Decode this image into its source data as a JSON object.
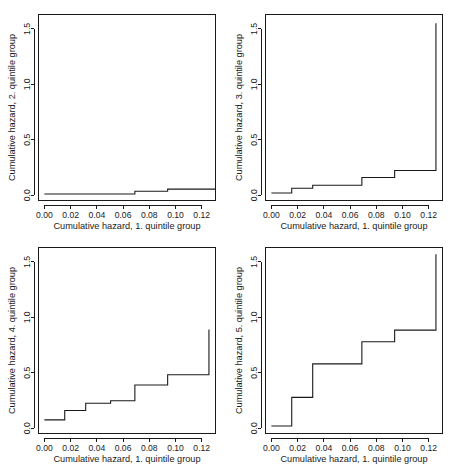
{
  "figure": {
    "background_color": "#ffffff",
    "line_color": "#1a1a1a",
    "panel_layout": "2x2",
    "panel_count": 4
  },
  "axes": {
    "x_ticks": [
      "0.00",
      "0.02",
      "0.04",
      "0.06",
      "0.08",
      "0.10",
      "0.12"
    ],
    "x_tick_values": [
      0.0,
      0.02,
      0.04,
      0.06,
      0.08,
      0.1,
      0.12
    ],
    "y_ticks": [
      "0.0",
      "0.5",
      "1.0",
      "1.5"
    ],
    "y_tick_values": [
      0.0,
      0.5,
      1.0,
      1.5
    ],
    "xlim": [
      -0.0045,
      0.1305
    ],
    "ylim": [
      -0.048,
      1.63
    ],
    "xlabel": "Cumulative hazard, 1. quintile group"
  },
  "chart_data": [
    {
      "type": "line",
      "subplot": "top-left",
      "title": "",
      "xlabel": "Cumulative hazard, 1. quintile group",
      "ylabel": "Cumulative hazard, 2. quintile group",
      "xlim": [
        -0.0045,
        0.1305
      ],
      "ylim": [
        -0.048,
        1.63
      ],
      "grid": false,
      "legend": "none",
      "step_style": "post",
      "x": [
        0.0,
        0.0155,
        0.0315,
        0.0505,
        0.069,
        0.094,
        0.1255
      ],
      "y": [
        0.01,
        0.01,
        0.01,
        0.01,
        0.035,
        0.055,
        0.055
      ],
      "xtick_labels": [
        "0.00",
        "0.02",
        "0.04",
        "0.06",
        "0.08",
        "0.10",
        "0.12"
      ],
      "ytick_labels": [
        "0.0",
        "0.5",
        "1.0",
        "1.5"
      ]
    },
    {
      "type": "line",
      "subplot": "top-right",
      "title": "",
      "xlabel": "Cumulative hazard, 1. quintile group",
      "ylabel": "Cumulative hazard, 3. quintile group",
      "xlim": [
        -0.0045,
        0.1305
      ],
      "ylim": [
        -0.048,
        1.63
      ],
      "grid": false,
      "legend": "none",
      "step_style": "post",
      "x": [
        0.0,
        0.0155,
        0.0315,
        0.069,
        0.094,
        0.1255,
        0.1255
      ],
      "y": [
        0.02,
        0.062,
        0.09,
        0.16,
        0.222,
        0.222,
        1.55
      ],
      "xtick_labels": [
        "0.00",
        "0.02",
        "0.04",
        "0.06",
        "0.08",
        "0.10",
        "0.12"
      ],
      "ytick_labels": [
        "0.0",
        "0.5",
        "1.0",
        "1.5"
      ]
    },
    {
      "type": "line",
      "subplot": "bottom-left",
      "title": "",
      "xlabel": "Cumulative hazard, 1. quintile group",
      "ylabel": "Cumulative hazard, 4. quintile group",
      "xlim": [
        -0.0045,
        0.1305
      ],
      "ylim": [
        -0.048,
        1.63
      ],
      "grid": false,
      "legend": "none",
      "step_style": "post",
      "x": [
        0.0,
        0.0155,
        0.0315,
        0.0505,
        0.069,
        0.094,
        0.1255,
        0.1255
      ],
      "y": [
        0.075,
        0.16,
        0.225,
        0.248,
        0.39,
        0.482,
        0.482,
        0.89
      ],
      "xtick_labels": [
        "0.00",
        "0.02",
        "0.04",
        "0.06",
        "0.08",
        "0.10",
        "0.12"
      ],
      "ytick_labels": [
        "0.0",
        "0.5",
        "1.0",
        "1.5"
      ]
    },
    {
      "type": "line",
      "subplot": "bottom-right",
      "title": "",
      "xlabel": "Cumulative hazard, 1. quintile group",
      "ylabel": "Cumulative hazard, 5. quintile group",
      "xlim": [
        -0.0045,
        0.1305
      ],
      "ylim": [
        -0.048,
        1.63
      ],
      "grid": false,
      "legend": "none",
      "step_style": "post",
      "x": [
        0.0,
        0.0155,
        0.0315,
        0.069,
        0.094,
        0.1255,
        0.1255
      ],
      "y": [
        0.02,
        0.278,
        0.58,
        0.78,
        0.885,
        1.3,
        1.57
      ],
      "xtick_labels": [
        "0.00",
        "0.02",
        "0.04",
        "0.06",
        "0.08",
        "0.10",
        "0.12"
      ],
      "ytick_labels": [
        "0.0",
        "0.5",
        "1.0",
        "1.5"
      ]
    }
  ]
}
